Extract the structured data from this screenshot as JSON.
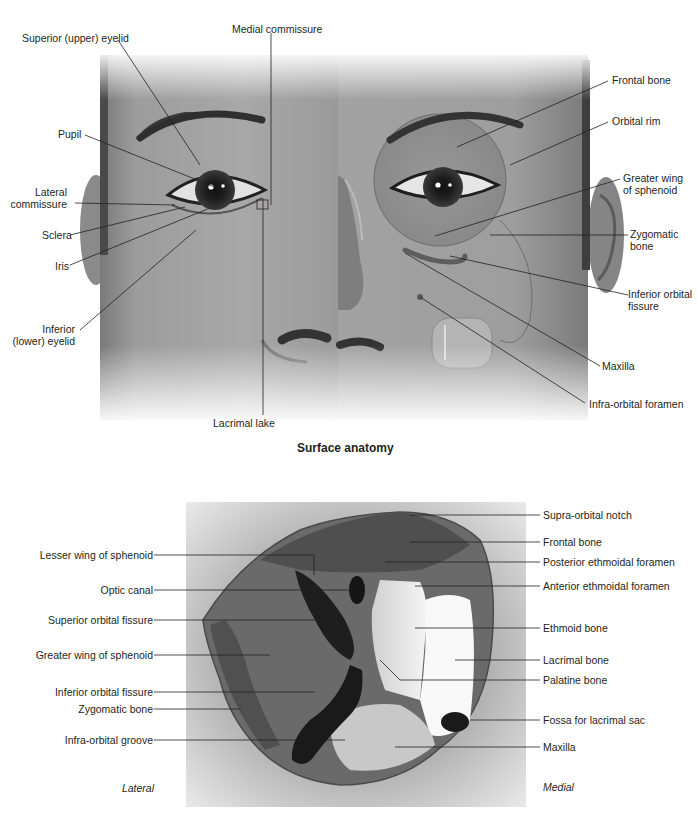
{
  "surface_anatomy": {
    "caption": "Surface anatomy",
    "left_labels": {
      "superior_eyelid": "Superior (upper) eyelid",
      "medial_commissure": "Medial commissure",
      "pupil": "Pupil",
      "lateral_commissure_1": "Lateral",
      "lateral_commissure_2": "commissure",
      "sclera": "Sclera",
      "iris": "Iris",
      "inferior_eyelid_1": "Inferior",
      "inferior_eyelid_2": "(lower) eyelid",
      "lacrimal_lake": "Lacrimal lake"
    },
    "right_labels": {
      "frontal_bone": "Frontal bone",
      "orbital_rim": "Orbital rim",
      "greater_wing_1": "Greater wing",
      "greater_wing_2": "of sphenoid",
      "zygomatic_1": "Zygomatic",
      "zygomatic_2": "bone",
      "inferior_orbital_fissure_1": "Inferior orbital",
      "inferior_orbital_fissure_2": "fissure",
      "maxilla": "Maxilla",
      "infra_orbital_foramen": "Infra-orbital foramen"
    }
  },
  "orbit": {
    "left_labels": {
      "lesser_wing": "Lesser wing of sphenoid",
      "optic_canal": "Optic canal",
      "superior_orbital_fissure": "Superior orbital fissure",
      "greater_wing": "Greater wing of sphenoid",
      "inferior_orbital_fissure": "Inferior orbital fissure",
      "zygomatic_bone": "Zygomatic bone",
      "infra_orbital_groove": "Infra-orbital groove"
    },
    "right_labels": {
      "supra_orbital_notch": "Supra-orbital notch",
      "frontal_bone": "Frontal bone",
      "posterior_ethmoidal_foramen": "Posterior ethmoidal foramen",
      "anterior_ethmoidal_foramen": "Anterior ethmoidal foramen",
      "ethmoid_bone": "Ethmoid bone",
      "lacrimal_bone": "Lacrimal bone",
      "palatine_bone": "Palatine bone",
      "fossa_lacrimal_sac": "Fossa for lacrimal sac",
      "maxilla": "Maxilla"
    },
    "orientation": {
      "lateral": "Lateral",
      "medial": "Medial"
    }
  }
}
